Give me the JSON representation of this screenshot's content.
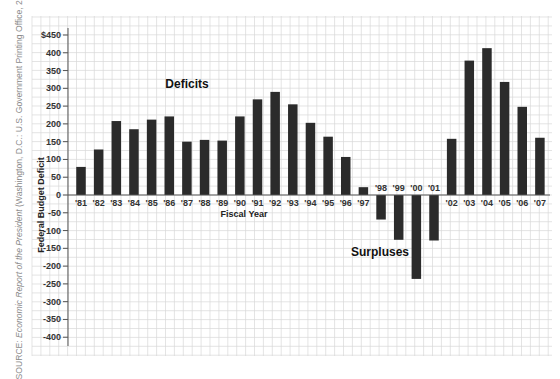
{
  "chart_data": {
    "type": "bar",
    "title": "",
    "xlabel": "Fiscal Year",
    "ylabel": "Federal Budget Deficit",
    "ylim": [
      -420,
      460
    ],
    "y_ticks": [
      450,
      400,
      350,
      300,
      250,
      200,
      150,
      100,
      50,
      0,
      -50,
      -100,
      -150,
      -200,
      -250,
      -300,
      -350,
      -400
    ],
    "y_tick_labels": [
      "$450",
      "400",
      "350",
      "300",
      "250",
      "200",
      "150",
      "100",
      "50",
      "0",
      "-50",
      "-100",
      "-150",
      "-200",
      "-250",
      "-300",
      "-350",
      "-400"
    ],
    "grid": true,
    "categories": [
      "'81",
      "'82",
      "'83",
      "'84",
      "'85",
      "'86",
      "'87",
      "'88",
      "'89",
      "'90",
      "'91",
      "'92",
      "'93",
      "'94",
      "'95",
      "'96",
      "'97",
      "'98",
      "'99",
      "'00",
      "'01",
      "'02",
      "'03",
      "'04",
      "'05",
      "'06",
      "'07"
    ],
    "values": [
      79,
      128,
      208,
      185,
      212,
      221,
      150,
      155,
      153,
      221,
      269,
      290,
      255,
      203,
      164,
      107,
      22,
      -69,
      -126,
      -236,
      -128,
      158,
      378,
      413,
      318,
      248,
      161
    ],
    "annotations": [
      {
        "text": "Deficits",
        "x": "'86",
        "y": 300
      },
      {
        "text": "Surpluses",
        "x": "'98",
        "y": -175
      }
    ],
    "bar_color": "#2b2b2b",
    "grid_color": "#d9d9d9",
    "legend": null
  },
  "source": {
    "prefix": "SOURCE: ",
    "italic": "Economic Report of the President",
    "suffix": " (Washington, D.C.: U.S. Government Printing Office, 2008)."
  }
}
